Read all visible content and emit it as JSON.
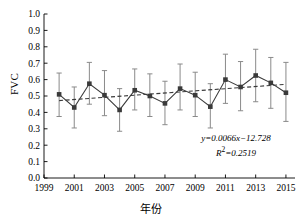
{
  "chart_data": {
    "type": "line",
    "title": "",
    "xlabel": "年份",
    "ylabel": "FVC",
    "xlim": [
      1999,
      2015.6
    ],
    "ylim": [
      0.0,
      1.0
    ],
    "grid": false,
    "legend": null,
    "x_ticks": [
      1999,
      2001,
      2003,
      2005,
      2007,
      2009,
      2011,
      2013,
      2015
    ],
    "x_tick_labels": [
      "1999",
      "2001",
      "2003",
      "2005",
      "2007",
      "2009",
      "2011",
      "2013",
      "2015"
    ],
    "y_ticks": [
      0.0,
      0.1,
      0.2,
      0.3,
      0.4,
      0.5,
      0.6,
      0.7,
      0.8,
      0.9,
      1.0
    ],
    "y_tick_labels": [
      "0.0",
      "0.1",
      "0.2",
      "0.3",
      "0.4",
      "0.5",
      "0.6",
      "0.7",
      "0.8",
      "0.9",
      "1.0"
    ],
    "series": [
      {
        "name": "FVC",
        "marker": "square",
        "color": "#3a3a3a",
        "x": [
          2000,
          2001,
          2002,
          2003,
          2004,
          2005,
          2006,
          2007,
          2008,
          2009,
          2010,
          2011,
          2012,
          2013,
          2014,
          2015
        ],
        "values": [
          0.51,
          0.43,
          0.575,
          0.505,
          0.415,
          0.535,
          0.5,
          0.455,
          0.545,
          0.505,
          0.435,
          0.6,
          0.555,
          0.625,
          0.58,
          0.52
        ],
        "err_upper": [
          0.64,
          0.555,
          0.705,
          0.655,
          0.545,
          0.665,
          0.635,
          0.59,
          0.695,
          0.645,
          0.575,
          0.755,
          0.71,
          0.785,
          0.735,
          0.705
        ],
        "err_lower": [
          0.375,
          0.305,
          0.45,
          0.38,
          0.285,
          0.415,
          0.375,
          0.325,
          0.415,
          0.375,
          0.305,
          0.455,
          0.41,
          0.465,
          0.425,
          0.345
        ]
      },
      {
        "name": "trend",
        "style": "dashed",
        "color": "#3a3a3a",
        "x": [
          2000,
          2015
        ],
        "values": [
          0.472,
          0.571
        ]
      }
    ],
    "annotations": {
      "equation": "y=0.0066x−12.728",
      "r_squared_label": "R",
      "r_squared_sup": "2",
      "r_squared_value": "=0.2519"
    }
  }
}
